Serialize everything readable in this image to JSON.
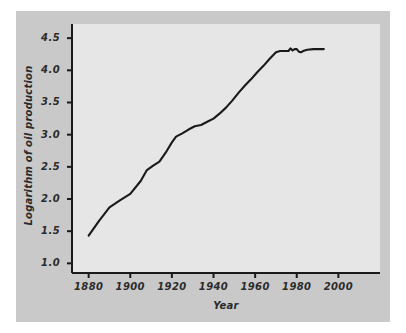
{
  "figure": {
    "background_color": "#c9c9c9",
    "panel_color": "#e6e6e6",
    "page_color": "#ffffff",
    "line_color": "#1a1a1a",
    "axis_color": "#1a1a1a"
  },
  "chart_data": {
    "type": "line",
    "title": "",
    "xlabel": "Year",
    "ylabel": "Logarithm of oil production",
    "xlim": [
      1872,
      2020
    ],
    "ylim": [
      0.85,
      4.72
    ],
    "grid": false,
    "legend": null,
    "xticks": [
      1880,
      1900,
      1920,
      1940,
      1960,
      1980,
      2000
    ],
    "xtick_labels": [
      "1880",
      "1900",
      "1920",
      "1940",
      "1960",
      "1980",
      "2000"
    ],
    "yticks": [
      1.0,
      1.5,
      2.0,
      2.5,
      3.0,
      3.5,
      4.0,
      4.5
    ],
    "ytick_labels": [
      "1.0",
      "1.5",
      "2.0",
      "2.5",
      "3.0",
      "3.5",
      "4.0",
      "4.5"
    ],
    "series": [
      {
        "name": "Logarithm of oil production",
        "x": [
          1880,
          1885,
          1890,
          1895,
          1900,
          1905,
          1908,
          1911,
          1914,
          1917,
          1920,
          1922,
          1925,
          1928,
          1931,
          1934,
          1937,
          1940,
          1943,
          1946,
          1949,
          1952,
          1955,
          1958,
          1961,
          1964,
          1967,
          1970,
          1972,
          1974,
          1976,
          1977,
          1978,
          1979,
          1980,
          1981,
          1982,
          1983,
          1985,
          1988,
          1990,
          1993
        ],
        "y": [
          1.43,
          1.66,
          1.87,
          1.98,
          2.08,
          2.28,
          2.45,
          2.52,
          2.58,
          2.72,
          2.88,
          2.97,
          3.02,
          3.08,
          3.13,
          3.15,
          3.2,
          3.25,
          3.33,
          3.42,
          3.53,
          3.65,
          3.76,
          3.86,
          3.97,
          4.07,
          4.18,
          4.28,
          4.3,
          4.3,
          4.3,
          4.34,
          4.31,
          4.33,
          4.33,
          4.29,
          4.28,
          4.3,
          4.32,
          4.33,
          4.33,
          4.33
        ]
      }
    ]
  },
  "axis": {
    "x_title": "Year",
    "y_title": "Logarithm of oil production"
  }
}
